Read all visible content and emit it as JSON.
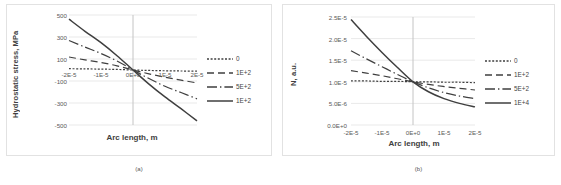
{
  "figure": {
    "panels": [
      {
        "subcaption": "(a)",
        "xlabel": "Arc length, m",
        "ylabel": "Hydrostatic stress, MPa"
      },
      {
        "subcaption": "(b)",
        "xlabel": "Arc length, m",
        "ylabel": "N, a.u."
      }
    ]
  },
  "chart_data": [
    {
      "type": "line",
      "title": "",
      "subcaption": "(a)",
      "xlabel": "Arc length, m",
      "ylabel": "Hydrostatic stress, MPa",
      "xlim": [
        -2e-05,
        2e-05
      ],
      "ylim": [
        -500,
        500
      ],
      "xticks": [
        -2e-05,
        -1e-05,
        0.0,
        1e-05,
        2e-05
      ],
      "xticklabels": [
        "-2E-5",
        "-1E-5",
        "0E+0",
        "1E-5",
        "2E-5"
      ],
      "yticks": [
        -500,
        -300,
        -100,
        100,
        300,
        500
      ],
      "yticklabels": [
        "-500",
        "-300",
        "-100",
        "100",
        "300",
        "500"
      ],
      "grid": true,
      "legend_position": "right",
      "x": [
        -2e-05,
        -1.5e-05,
        -1e-05,
        -5e-06,
        0.0,
        5e-06,
        1e-05,
        1.5e-05,
        2e-05
      ],
      "series": [
        {
          "name": "0",
          "dash": "dotted",
          "values": [
            12,
            10,
            8,
            5,
            0,
            -4,
            -7,
            -9,
            -11
          ]
        },
        {
          "name": "1E+2",
          "dash": "dashed",
          "values": [
            118,
            92,
            68,
            38,
            0,
            -35,
            -65,
            -92,
            -118
          ]
        },
        {
          "name": "5E+2",
          "dash": "dash-dot",
          "values": [
            268,
            208,
            150,
            82,
            0,
            -78,
            -148,
            -205,
            -262
          ]
        },
        {
          "name": "1E+2",
          "dash": "solid",
          "values": [
            462,
            352,
            248,
            130,
            0,
            -128,
            -245,
            -352,
            -462
          ]
        }
      ]
    },
    {
      "type": "line",
      "title": "",
      "subcaption": "(b)",
      "xlabel": "Arc length, m",
      "ylabel": "N, a.u.",
      "xlim": [
        -2e-05,
        2e-05
      ],
      "ylim": [
        0.0,
        2.5e-05
      ],
      "xticks": [
        -2e-05,
        -1e-05,
        0.0,
        1e-05,
        2e-05
      ],
      "xticklabels": [
        "-2E-5",
        "-1E-5",
        "0E+0",
        "1E-5",
        "2E-5"
      ],
      "yticks": [
        0.0,
        5e-06,
        1e-05,
        1.5e-05,
        2e-05,
        2.5e-05
      ],
      "yticklabels": [
        "0.0E+0",
        "5.0E-6",
        "1.0E-5",
        "1.5E-5",
        "2.0E-5",
        "2.5E-5"
      ],
      "grid": true,
      "legend_position": "right",
      "x": [
        -2e-05,
        -1.5e-05,
        -1e-05,
        -5e-06,
        0.0,
        5e-06,
        1e-05,
        1.5e-05,
        2e-05
      ],
      "series": [
        {
          "name": "0",
          "dash": "dotted",
          "values": [
            1.02e-05,
            1.02e-05,
            1.01e-05,
            1.01e-05,
            1e-05,
            1e-05,
            9.9e-06,
            9.9e-06,
            9.8e-06
          ]
        },
        {
          "name": "1E+2",
          "dash": "dashed",
          "values": [
            1.26e-05,
            1.2e-05,
            1.14e-05,
            1.07e-05,
            1e-05,
            9.4e-06,
            8.9e-06,
            8.5e-06,
            8.1e-06
          ]
        },
        {
          "name": "5E+2",
          "dash": "dash-dot",
          "values": [
            1.72e-05,
            1.53e-05,
            1.35e-05,
            1.17e-05,
            1e-05,
            8.6e-06,
            7.5e-06,
            6.7e-06,
            6.1e-06
          ]
        },
        {
          "name": "1E+4",
          "dash": "solid",
          "values": [
            2.44e-05,
            2.05e-05,
            1.68e-05,
            1.33e-05,
            1e-05,
            7.7e-06,
            6.1e-06,
            5e-06,
            4.2e-06
          ]
        }
      ]
    }
  ]
}
